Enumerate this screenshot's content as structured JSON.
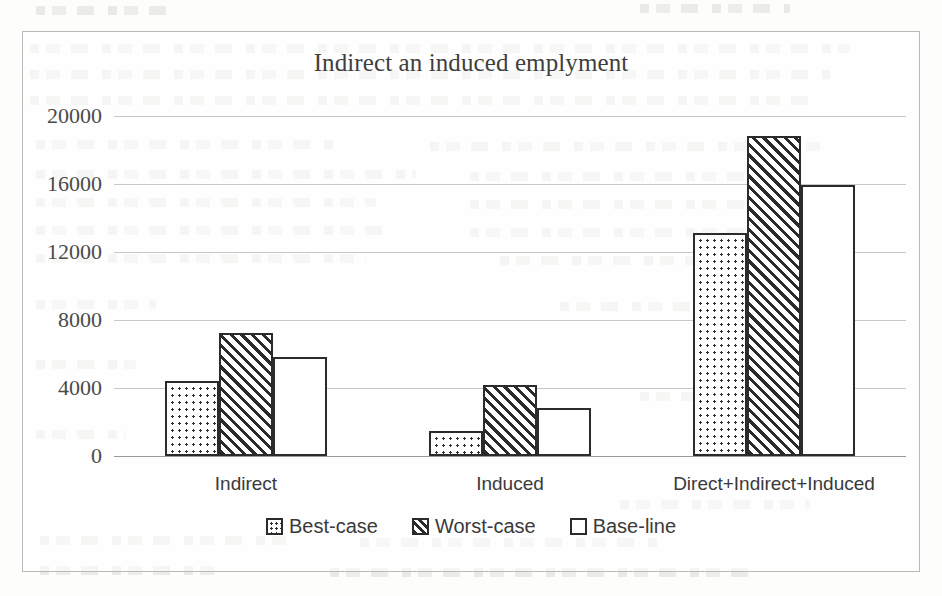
{
  "chart_data": {
    "type": "bar",
    "title": "Indirect an induced emplyment",
    "xlabel": "",
    "ylabel": "",
    "ylim": [
      0,
      20000
    ],
    "ytick_values": [
      0,
      4000,
      8000,
      12000,
      16000,
      20000
    ],
    "ytick_labels": [
      "0",
      "4000",
      "8000",
      "12000",
      "16000",
      "20000"
    ],
    "grid": true,
    "legend_position": "bottom",
    "categories": [
      "Indirect",
      "Induced",
      "Direct+Indirect+Induced"
    ],
    "series": [
      {
        "name": "Best-case",
        "pattern": "dotted",
        "values": [
          4400,
          1450,
          13100
        ]
      },
      {
        "name": "Worst-case",
        "pattern": "diagonal-hatch",
        "values": [
          7250,
          4200,
          18800
        ]
      },
      {
        "name": "Base-line",
        "pattern": "solid-white",
        "values": [
          5800,
          2850,
          15950
        ]
      }
    ],
    "colors": {
      "bar_outline": "#2b2b2b",
      "bar_fill": "#ffffff",
      "gridline": "#c8c8c4",
      "axis": "#9a9a96",
      "title_text": "#3f3f3f",
      "label_text": "#3a3a3a",
      "frame_border": "#b9b9b5",
      "page_background": "#fdfdfc"
    }
  }
}
